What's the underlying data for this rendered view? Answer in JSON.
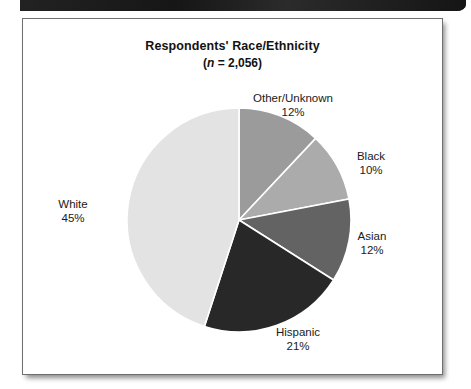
{
  "page": {
    "top_bar_name": "scan-edge-bar"
  },
  "chart": {
    "title": "Respondents' Race/Ethnicity",
    "subtitle_prefix": "(",
    "subtitle_n": "n",
    "subtitle_rest": " = 2,056)"
  },
  "chart_data": {
    "type": "pie",
    "title": "Respondents' Race/Ethnicity",
    "subtitle": "(n = 2,056)",
    "n": 2056,
    "unit": "%",
    "legend": "none",
    "start_angle_deg": 0,
    "direction": "clockwise",
    "categories": [
      "Other/Unknown",
      "Black",
      "Asian",
      "Hispanic",
      "White"
    ],
    "values": [
      12,
      10,
      12,
      21,
      45
    ],
    "labels": [
      {
        "name": "Other/Unknown",
        "value": 12,
        "pct_text": "12%",
        "color": "#9b9b9b",
        "start_deg": 0,
        "end_deg": 43.2
      },
      {
        "name": "Black",
        "value": 10,
        "pct_text": "10%",
        "color": "#ababab",
        "start_deg": 43.2,
        "end_deg": 79.2
      },
      {
        "name": "Asian",
        "value": 12,
        "pct_text": "12%",
        "color": "#636363",
        "start_deg": 79.2,
        "end_deg": 122.4
      },
      {
        "name": "Hispanic",
        "value": 21,
        "pct_text": "21%",
        "color": "#282828",
        "start_deg": 122.4,
        "end_deg": 198.0
      },
      {
        "name": "White",
        "value": 45,
        "pct_text": "45%",
        "color": "#e3e3e3",
        "start_deg": 198.0,
        "end_deg": 360.0
      }
    ],
    "colors": [
      "#9b9b9b",
      "#ababab",
      "#636363",
      "#282828",
      "#e3e3e3"
    ],
    "slice_border_color": "#ffffff"
  }
}
